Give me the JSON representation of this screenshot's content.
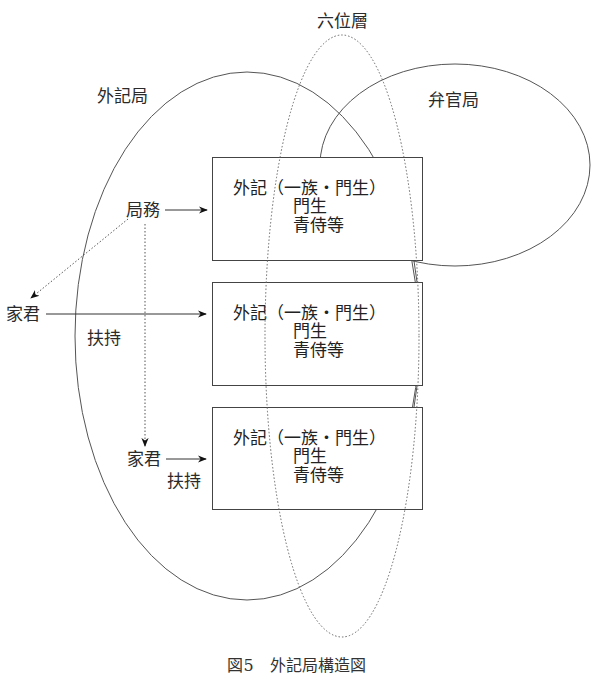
{
  "diagram": {
    "groups": {
      "gekikyoku": "外記局",
      "benkankyoku": "弁官局",
      "rokuisou": "六位層"
    },
    "boxes": [
      {
        "line1": "外記（一族・門生）",
        "line2": "門生",
        "line3": "青侍等"
      },
      {
        "line1": "外記（一族・門生）",
        "line2": "門生",
        "line3": "青侍等"
      },
      {
        "line1": "外記（一族・門生）",
        "line2": "門生",
        "line3": "青侍等"
      }
    ],
    "labels": {
      "kyokumu": "局務",
      "kakun_1": "家君",
      "fuji_1": "扶持",
      "kakun_2": "家君",
      "fuji_2": "扶持"
    },
    "caption": "図5　外記局構造図"
  }
}
